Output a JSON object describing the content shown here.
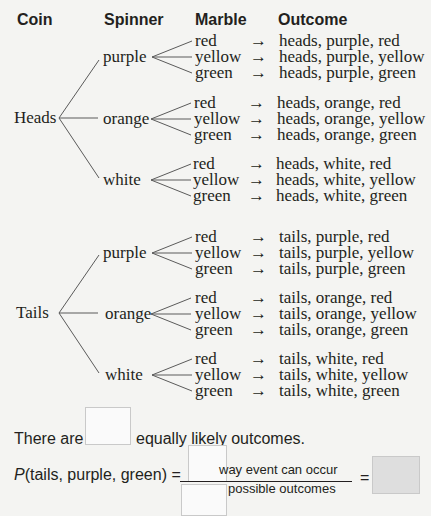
{
  "headers": {
    "coin": "Coin",
    "spinner": "Spinner",
    "marble": "Marble",
    "outcome": "Outcome"
  },
  "coins": [
    {
      "label": "Heads",
      "spinners": [
        {
          "label": "purple",
          "marbles": [
            "red",
            "yellow",
            "green"
          ],
          "outcomes": [
            "heads, purple, red",
            "heads, purple, yellow",
            "heads, purple, green"
          ]
        },
        {
          "label": "orange",
          "marbles": [
            "red",
            "yellow",
            "green"
          ],
          "outcomes": [
            "heads, orange, red",
            "heads, orange, yellow",
            "heads, orange, green"
          ]
        },
        {
          "label": "white",
          "marbles": [
            "red",
            "yellow",
            "green"
          ],
          "outcomes": [
            "heads, white, red",
            "heads, white, yellow",
            "heads, white, green"
          ]
        }
      ]
    },
    {
      "label": "Tails",
      "spinners": [
        {
          "label": "purple",
          "marbles": [
            "red",
            "yellow",
            "green"
          ],
          "outcomes": [
            "tails, purple, red",
            "tails, purple, yellow",
            "tails, purple, green"
          ]
        },
        {
          "label": "orange",
          "marbles": [
            "red",
            "yellow",
            "green"
          ],
          "outcomes": [
            "tails, orange, red",
            "tails, orange, yellow",
            "tails, orange, green"
          ]
        },
        {
          "label": "white",
          "marbles": [
            "red",
            "yellow",
            "green"
          ],
          "outcomes": [
            "tails, white, red",
            "tails, white, yellow",
            "tails, white, green"
          ]
        }
      ]
    }
  ],
  "arrow": "→",
  "question1": {
    "prefix": "There are",
    "suffix": "equally likely outcomes.",
    "answer": ""
  },
  "question2": {
    "p_letter": "P",
    "event": "(tails, purple, green) =",
    "numerator_label": "way event can occur",
    "denominator_label": "possible outcomes",
    "equals": "=",
    "numerator_answer": "",
    "denominator_answer": "",
    "result_answer": ""
  }
}
